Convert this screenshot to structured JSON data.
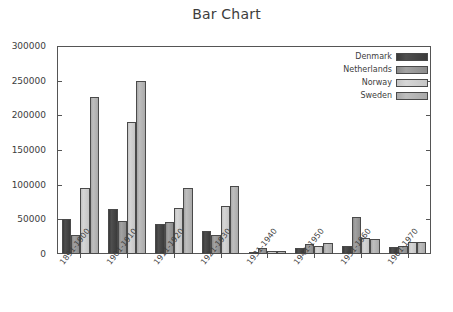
{
  "chart_data": {
    "type": "bar",
    "title": "Bar Chart",
    "xlabel": "",
    "ylabel": "",
    "ylim": [
      0,
      300000
    ],
    "ytick_values": [
      0,
      50000,
      100000,
      150000,
      200000,
      250000,
      300000
    ],
    "ytick_labels": [
      "0",
      "50000",
      "100000",
      "150000",
      "200000",
      "250000",
      "300000"
    ],
    "grid": false,
    "legend_position": "top-right",
    "categories": [
      "1891-1900",
      "1901-1910",
      "1911-1920",
      "1921-1930",
      "1931-1940",
      "1941-1950",
      "1951-1960",
      "1961-1970"
    ],
    "series": [
      {
        "name": "Denmark",
        "color": "#3d3d3d",
        "values": [
          50000,
          65000,
          44000,
          33000,
          3000,
          8000,
          11000,
          10000
        ]
      },
      {
        "name": "Netherlands",
        "color": "#939393",
        "values": [
          28000,
          48000,
          46000,
          27000,
          8000,
          15000,
          53000,
          11000
        ]
      },
      {
        "name": "Norway",
        "color": "#cccccc",
        "values": [
          95000,
          190000,
          66000,
          69000,
          5000,
          11000,
          23000,
          17000
        ]
      },
      {
        "name": "Sweden",
        "color": "#b4b4b4",
        "values": [
          226000,
          250000,
          95000,
          98000,
          4000,
          16000,
          22000,
          18000
        ]
      }
    ]
  }
}
